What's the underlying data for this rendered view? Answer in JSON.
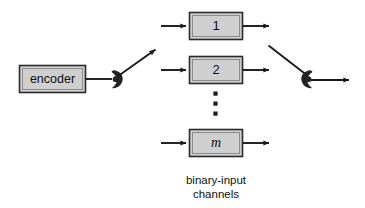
{
  "figure": {
    "kind": "block-diagram",
    "background_color": "#ffffff",
    "line_color": "#1a1a1a",
    "box_fill_color": "#cfcfcf",
    "box_border_color": "#2b2b2b",
    "switch_color": "#232323"
  },
  "encoder": {
    "label": "encoder"
  },
  "channels": {
    "items": [
      {
        "label": "1"
      },
      {
        "label": "2"
      },
      {
        "label": "m"
      }
    ],
    "ellipsis": "vertical-dots"
  },
  "switches": {
    "left": {
      "name": "input-selector-switch"
    },
    "right": {
      "name": "output-selector-switch"
    }
  },
  "caption": {
    "line1": "binary-input",
    "line2": "channels"
  }
}
